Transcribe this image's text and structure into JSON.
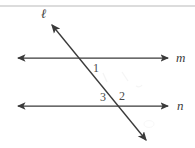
{
  "figure": {
    "background_color": "#ffffff",
    "stroke_color": "#3a3a3a",
    "top_rule_color": "#b9b9b9",
    "labels": {
      "transversal": "ℓ",
      "line_m": "m",
      "line_n": "n",
      "angle_1": "1",
      "angle_3": "3",
      "angle_2": "2"
    },
    "geometry": {
      "line_m": {
        "x1": 18,
        "y1": 58,
        "x2": 168,
        "y2": 58,
        "arrows": "both"
      },
      "line_n": {
        "x1": 18,
        "y1": 106,
        "x2": 168,
        "y2": 106,
        "arrows": "both"
      },
      "transversal": {
        "x1": 52,
        "y1": 25,
        "x2": 146,
        "y2": 140,
        "arrows": "both"
      },
      "intersection_m": {
        "x": 82,
        "y": 58
      },
      "intersection_n": {
        "x": 117,
        "y": 106
      },
      "top_rule": {
        "x1": 0,
        "y1": 6,
        "x2": 195,
        "y2": 6
      }
    }
  }
}
